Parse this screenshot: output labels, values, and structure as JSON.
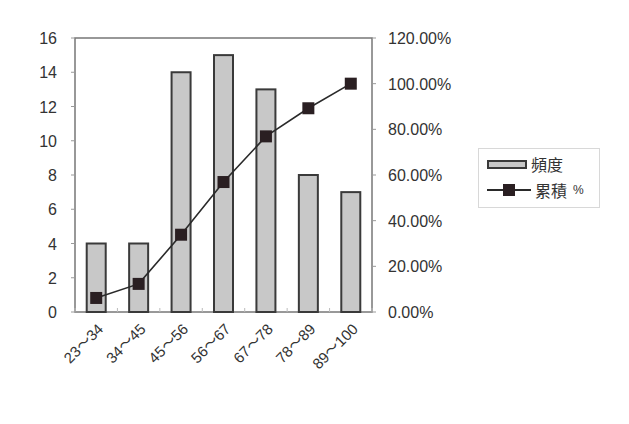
{
  "chart_data": {
    "type": "bar+line",
    "title": "",
    "xlabel": "",
    "ylabel": "",
    "categories": [
      "23～34",
      "34～45",
      "45～56",
      "56～67",
      "67～78",
      "78～89",
      "89～100"
    ],
    "series": [
      {
        "name": "頻度",
        "type": "bar",
        "axis": "left",
        "values": [
          4,
          4,
          14,
          15,
          13,
          8,
          7
        ],
        "color": "#c8c8c8",
        "edge_color": "#3a3a3a"
      },
      {
        "name": "累積 %",
        "type": "line",
        "axis": "right",
        "values": [
          6.15,
          12.31,
          33.85,
          56.92,
          76.92,
          89.23,
          100.0
        ],
        "color": "#2a2a2a",
        "marker": "square"
      }
    ],
    "y_left": {
      "ylim": [
        0,
        16
      ],
      "ticks": [
        0,
        2,
        4,
        6,
        8,
        10,
        12,
        14,
        16
      ]
    },
    "y_right": {
      "ylim": [
        0,
        120
      ],
      "ticks": [
        "0.00%",
        "20.00%",
        "40.00%",
        "60.00%",
        "80.00%",
        "100.00%",
        "120.00%"
      ]
    },
    "grid": false,
    "legend_position": "right"
  },
  "legend": {
    "bar_label": "頻度",
    "line_label": "累積",
    "line_suffix": "%"
  }
}
